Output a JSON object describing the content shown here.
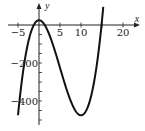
{
  "chart_data": {
    "type": "line",
    "title": "",
    "xlabel": "x",
    "ylabel": "y",
    "xlim": [
      -6,
      22
    ],
    "ylim": [
      -520,
      60
    ],
    "x_ticks": [
      -5,
      5,
      10,
      20
    ],
    "x_tick_labels": [
      "-5",
      "5",
      "10",
      "20"
    ],
    "y_ticks": [
      -200,
      -400
    ],
    "y_tick_labels": [
      "-200",
      "-400"
    ],
    "grid": false,
    "legend": null,
    "series": [
      {
        "name": "y = x^3 - 15x^2 + 25 (approx.)",
        "x": [
          -5,
          -4,
          -3,
          -2,
          -1,
          0,
          1,
          2,
          3,
          4,
          5,
          6,
          7,
          8,
          9,
          10,
          11,
          12,
          13,
          14,
          15,
          15.3
        ],
        "values": [
          -475,
          -279,
          -137,
          -43,
          9,
          25,
          11,
          -27,
          -83,
          -151,
          -225,
          -299,
          -367,
          -423,
          -461,
          -475,
          -459,
          -407,
          -313,
          -171,
          25,
          99
        ]
      }
    ],
    "annotations": {
      "local_max": {
        "x": 0,
        "y": 25
      },
      "local_min": {
        "x": 10,
        "y": -475
      }
    }
  },
  "axes": {
    "x_axis_label": "x",
    "y_axis_label": "y"
  }
}
